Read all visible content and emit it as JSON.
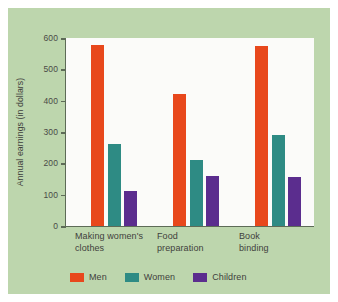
{
  "chart_data": {
    "type": "bar",
    "title": "",
    "xlabel": "",
    "ylabel": "Annual earnings (in dollars)",
    "categories": [
      "Making women's\nclothes",
      "Food\npreparation",
      "Book\nbinding"
    ],
    "series": [
      {
        "name": "Men",
        "color": "#e8481c",
        "values": [
          578,
          422,
          575
        ]
      },
      {
        "name": "Women",
        "color": "#2e8b84",
        "values": [
          262,
          211,
          290
        ]
      },
      {
        "name": "Children",
        "color": "#5b2d8e",
        "values": [
          112,
          160,
          157
        ]
      }
    ],
    "ylim": [
      0,
      600
    ],
    "yticks": [
      0,
      100,
      200,
      300,
      400,
      500,
      600
    ],
    "ytick_labels": [
      "0",
      "100",
      "200",
      "300",
      "400",
      "500",
      "600"
    ],
    "grid": false,
    "legend_position": "bottom-left"
  },
  "colors": {
    "panel_background": "#bdd6ad",
    "plot_background": "#fbfbf9",
    "axis": "#5d6b57",
    "text": "#3f3f3c",
    "men": "#e8481c",
    "women": "#2e8b84",
    "children": "#5b2d8e"
  }
}
